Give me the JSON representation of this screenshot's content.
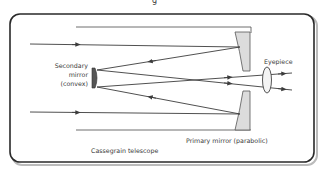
{
  "diagram": {
    "title_fragment": "g",
    "caption": "Cassegrain telescope",
    "labels": {
      "secondary_line1": "Secondary",
      "secondary_line2": "mirror",
      "secondary_line3": "(convex)",
      "eyepiece": "Eyepiece",
      "primary": "Primary mirror (parabolic)"
    },
    "colors": {
      "line": "#3c3c3c",
      "mirror_fill": "#dcdcdc",
      "frame": "#2a2a2a",
      "background": "#ffffff"
    }
  }
}
